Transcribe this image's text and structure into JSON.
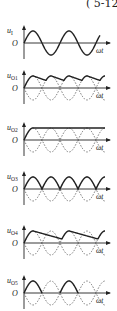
{
  "header": {
    "text": "( 5-12"
  },
  "panels": [
    {
      "id": "uI",
      "ylabel": "u",
      "sub": "I",
      "origin": "O",
      "xlabel": "ωt",
      "axis_y": 43,
      "kind": "sine"
    },
    {
      "id": "uO1",
      "ylabel": "u",
      "sub": "O1",
      "origin": "O",
      "xlabel": "ωt",
      "axis_y": 88,
      "kind": "ripple_full"
    },
    {
      "id": "uO2",
      "ylabel": "u",
      "sub": "O2",
      "origin": "O",
      "xlabel": "ωt",
      "axis_y": 140,
      "kind": "flat"
    },
    {
      "id": "uO3",
      "ylabel": "u",
      "sub": "O3",
      "origin": "O",
      "xlabel": "ωt",
      "axis_y": 189,
      "kind": "full_rect"
    },
    {
      "id": "uO4",
      "ylabel": "u",
      "sub": "O4",
      "origin": "O",
      "xlabel": "ωt",
      "axis_y": 243,
      "kind": "ripple_half"
    },
    {
      "id": "uO5",
      "ylabel": "u",
      "sub": "O5",
      "origin": "O",
      "xlabel": "ωt",
      "axis_y": 293,
      "kind": "half_rect"
    }
  ],
  "colors": {
    "ink": "#222222",
    "dashed": "#555555"
  }
}
